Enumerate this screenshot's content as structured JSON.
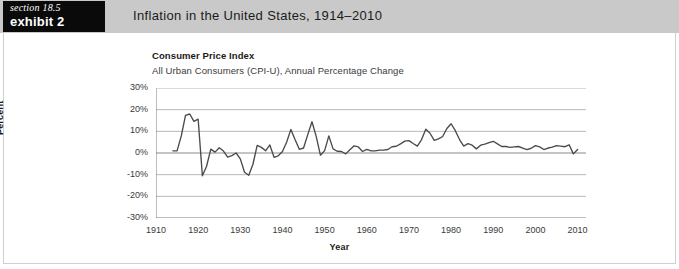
{
  "header": {
    "section_label": "section 18.5",
    "exhibit_label": "exhibit 2",
    "title": "Inflation in the United States, 1914–2010"
  },
  "chart_data": {
    "type": "line",
    "title": "Consumer Price Index",
    "subtitle": "All Urban Consumers (CPI-U), Annual Percentage Change",
    "xlabel": "Year",
    "ylabel": "Percent",
    "xlim": [
      1910,
      2012
    ],
    "ylim": [
      -30,
      30
    ],
    "ytick_values": [
      30,
      20,
      10,
      0,
      -10,
      -20,
      -30
    ],
    "ytick_labels": [
      "30%",
      "20%",
      "10%",
      "0%",
      "-10%",
      "-20%",
      "-30%"
    ],
    "xtick_values": [
      1910,
      1920,
      1930,
      1940,
      1950,
      1960,
      1970,
      1980,
      1990,
      2000,
      2010
    ],
    "xtick_labels": [
      "1910",
      "1920",
      "1930",
      "1940",
      "1950",
      "1960",
      "1970",
      "1980",
      "1990",
      "2000",
      "2010"
    ],
    "minor_tick_interval": 2,
    "grid": "horizontal",
    "grid_color": "#b0b0b0",
    "line_color": "#4a4a4a",
    "legend": "none",
    "series": [
      {
        "name": "CPI-U Annual Percentage Change",
        "x": [
          1914,
          1915,
          1916,
          1917,
          1918,
          1919,
          1920,
          1921,
          1922,
          1923,
          1924,
          1925,
          1926,
          1927,
          1928,
          1929,
          1930,
          1931,
          1932,
          1933,
          1934,
          1935,
          1936,
          1937,
          1938,
          1939,
          1940,
          1941,
          1942,
          1943,
          1944,
          1945,
          1946,
          1947,
          1948,
          1949,
          1950,
          1951,
          1952,
          1953,
          1954,
          1955,
          1956,
          1957,
          1958,
          1959,
          1960,
          1961,
          1962,
          1963,
          1964,
          1965,
          1966,
          1967,
          1968,
          1969,
          1970,
          1971,
          1972,
          1973,
          1974,
          1975,
          1976,
          1977,
          1978,
          1979,
          1980,
          1981,
          1982,
          1983,
          1984,
          1985,
          1986,
          1987,
          1988,
          1989,
          1990,
          1991,
          1992,
          1993,
          1994,
          1995,
          1996,
          1997,
          1998,
          1999,
          2000,
          2001,
          2002,
          2003,
          2004,
          2005,
          2006,
          2007,
          2008,
          2009,
          2010
        ],
        "y": [
          1.0,
          1.0,
          7.9,
          17.4,
          18.0,
          14.6,
          15.6,
          -10.5,
          -6.1,
          1.8,
          0.4,
          2.4,
          0.9,
          -1.9,
          -1.2,
          0.0,
          -2.7,
          -8.9,
          -10.3,
          -5.2,
          3.5,
          2.6,
          1.0,
          3.7,
          -2.0,
          -1.3,
          0.7,
          5.1,
          10.9,
          6.1,
          1.7,
          2.3,
          8.5,
          14.4,
          7.7,
          -1.0,
          1.1,
          7.9,
          1.9,
          0.8,
          0.7,
          -0.4,
          1.5,
          3.3,
          2.8,
          0.7,
          1.7,
          1.0,
          1.0,
          1.3,
          1.3,
          1.6,
          2.9,
          3.1,
          4.2,
          5.5,
          5.7,
          4.4,
          3.2,
          6.2,
          11.0,
          9.1,
          5.8,
          6.5,
          7.6,
          11.3,
          13.5,
          10.3,
          6.2,
          3.2,
          4.3,
          3.6,
          1.9,
          3.6,
          4.1,
          4.8,
          5.4,
          4.2,
          3.0,
          3.0,
          2.6,
          2.8,
          3.0,
          2.3,
          1.6,
          2.2,
          3.4,
          2.8,
          1.6,
          2.3,
          2.7,
          3.4,
          3.2,
          2.9,
          3.8,
          -0.4,
          1.6
        ]
      }
    ]
  }
}
